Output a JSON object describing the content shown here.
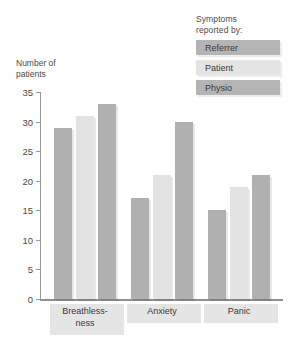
{
  "chart_data": {
    "type": "bar",
    "title": "",
    "xlabel": "",
    "ylabel": "Number of patients",
    "ylabel_lines": [
      "Number of",
      "patients"
    ],
    "ylim": [
      0,
      35
    ],
    "yticks": [
      0,
      5,
      10,
      15,
      20,
      25,
      30,
      35
    ],
    "ytick_labels": [
      "0",
      "5",
      "10",
      "15",
      "20",
      "25",
      "30",
      "35"
    ],
    "grid": false,
    "legend_position": "top-right",
    "legend_title": "Symptoms reported by:",
    "legend_title_lines": [
      "Symptoms",
      "reported by:"
    ],
    "categories": [
      "Breathless-ness",
      "Anxiety",
      "Panic"
    ],
    "category_label_lines": [
      [
        "Breathless-",
        "ness"
      ],
      [
        "Anxiety"
      ],
      [
        "Panic"
      ]
    ],
    "series": [
      {
        "name": "Referrer",
        "color": "#b0b0b0",
        "values": [
          29,
          17,
          15
        ]
      },
      {
        "name": "Patient",
        "color": "#e3e3e3",
        "values": [
          31,
          21,
          19
        ]
      },
      {
        "name": "Physio",
        "color": "#b0b0b0",
        "values": [
          33,
          30,
          21
        ]
      }
    ]
  }
}
